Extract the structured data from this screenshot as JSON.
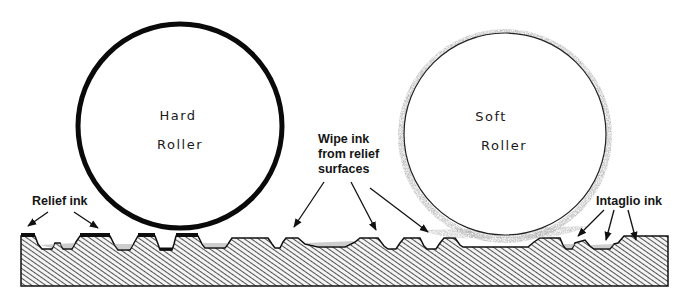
{
  "diagram": {
    "rollers": [
      {
        "id": "hard",
        "label_line1": "Hard",
        "label_line2": "Roller"
      },
      {
        "id": "soft",
        "label_line1": "Soft",
        "label_line2": "Roller"
      }
    ],
    "callouts": {
      "relief_ink": "Relief ink",
      "wipe_line1": "Wipe ink",
      "wipe_line2": "from relief",
      "wipe_line3": "surfaces",
      "intaglio_ink": "Intaglio ink"
    },
    "colors": {
      "ink": "#111111",
      "hatch": "#333333",
      "soft_edge": "#9a9a9a",
      "background": "#ffffff"
    }
  }
}
